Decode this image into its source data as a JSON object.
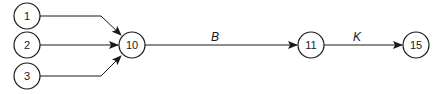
{
  "diagram": {
    "type": "activity-network",
    "nodes": [
      {
        "id": "1",
        "label": "1",
        "cx": 27,
        "cy": 16
      },
      {
        "id": "2",
        "label": "2",
        "cx": 27,
        "cy": 45
      },
      {
        "id": "3",
        "label": "3",
        "cx": 27,
        "cy": 76
      },
      {
        "id": "10",
        "label": "10",
        "cx": 132,
        "cy": 45
      },
      {
        "id": "11",
        "label": "11",
        "cx": 311,
        "cy": 45
      },
      {
        "id": "15",
        "label": "15",
        "cx": 416,
        "cy": 45
      }
    ],
    "edges": [
      {
        "from": "1",
        "to": "10",
        "label": ""
      },
      {
        "from": "2",
        "to": "10",
        "label": ""
      },
      {
        "from": "3",
        "to": "10",
        "label": ""
      },
      {
        "from": "10",
        "to": "11",
        "label": "B"
      },
      {
        "from": "11",
        "to": "15",
        "label": "K"
      }
    ],
    "colors": {
      "stroke": "#1a1a1a",
      "background": "#ffffff"
    }
  }
}
